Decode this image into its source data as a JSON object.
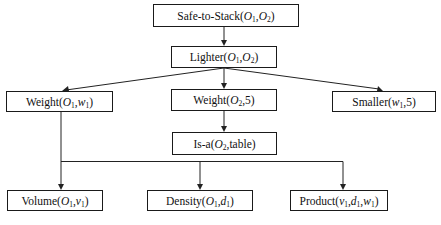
{
  "diagram": {
    "type": "goal-regression-tree",
    "nodes": [
      {
        "id": "safe_to_stack",
        "predicate": "Safe-to-Stack",
        "args": [
          {
            "name": "O",
            "sub": "1"
          },
          {
            "name": "O",
            "sub": "2"
          }
        ],
        "label": "Safe-to-Stack(O1,O2)",
        "box": {
          "x": 153,
          "y": 4,
          "w": 146,
          "h": 23
        }
      },
      {
        "id": "lighter",
        "predicate": "Lighter",
        "args": [
          {
            "name": "O",
            "sub": "1"
          },
          {
            "name": "O",
            "sub": "2"
          }
        ],
        "label": "Lighter(O1,O2)",
        "box": {
          "x": 171,
          "y": 46,
          "w": 106,
          "h": 22
        }
      },
      {
        "id": "weight_o1_w1",
        "predicate": "Weight",
        "args": [
          {
            "name": "O",
            "sub": "1"
          },
          {
            "name": "w",
            "sub": "1"
          }
        ],
        "label": "Weight(O1,w1)",
        "box": {
          "x": 6,
          "y": 91,
          "w": 107,
          "h": 21
        }
      },
      {
        "id": "weight_o2_5",
        "predicate": "Weight",
        "args": [
          {
            "name": "O",
            "sub": "2"
          },
          {
            "text": "5"
          }
        ],
        "label": "Weight(O2,5)",
        "box": {
          "x": 171,
          "y": 89,
          "w": 106,
          "h": 22
        }
      },
      {
        "id": "smaller",
        "predicate": "Smaller",
        "args": [
          {
            "name": "w",
            "sub": "1"
          },
          {
            "text": "5"
          }
        ],
        "label": "Smaller(w1,5)",
        "box": {
          "x": 332,
          "y": 91,
          "w": 104,
          "h": 21
        }
      },
      {
        "id": "is_a",
        "predicate": "Is-a",
        "args": [
          {
            "name": "O",
            "sub": "2"
          },
          {
            "text": "table"
          }
        ],
        "label": "Is-a(O2,table)",
        "box": {
          "x": 172,
          "y": 132,
          "w": 105,
          "h": 23
        }
      },
      {
        "id": "volume",
        "predicate": "Volume",
        "args": [
          {
            "name": "O",
            "sub": "1"
          },
          {
            "name": "v",
            "sub": "1"
          }
        ],
        "label": "Volume(O1,v1)",
        "box": {
          "x": 7,
          "y": 190,
          "w": 96,
          "h": 21
        }
      },
      {
        "id": "density",
        "predicate": "Density",
        "args": [
          {
            "name": "O",
            "sub": "1"
          },
          {
            "name": "d",
            "sub": "1"
          }
        ],
        "label": "Density(O1,d1)",
        "box": {
          "x": 147,
          "y": 190,
          "w": 106,
          "h": 21
        }
      },
      {
        "id": "product",
        "predicate": "Product",
        "args": [
          {
            "name": "v",
            "sub": "1"
          },
          {
            "name": "d",
            "sub": "1"
          },
          {
            "name": "w",
            "sub": "1"
          }
        ],
        "label": "Product(v1,d1,w1)",
        "box": {
          "x": 290,
          "y": 190,
          "w": 98,
          "h": 21
        }
      }
    ],
    "edges": [
      {
        "from": "safe_to_stack",
        "to": "lighter"
      },
      {
        "from": "lighter",
        "to": "weight_o1_w1"
      },
      {
        "from": "lighter",
        "to": "weight_o2_5"
      },
      {
        "from": "lighter",
        "to": "smaller"
      },
      {
        "from": "weight_o2_5",
        "to": "is_a"
      },
      {
        "from": "weight_o1_w1",
        "to": "volume"
      },
      {
        "from": "weight_o1_w1",
        "to": "density"
      },
      {
        "from": "weight_o1_w1",
        "to": "product"
      }
    ],
    "colors": {
      "line": "#222222",
      "border": "#1a1a1a",
      "text": "#111111",
      "background": "#ffffff"
    }
  }
}
